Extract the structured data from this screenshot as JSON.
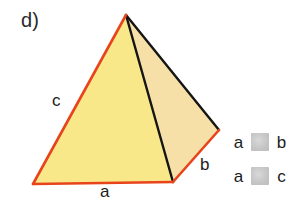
{
  "figure": {
    "item_label": "d)",
    "shape_name": "square pyramid",
    "edge_labels": {
      "left_slant": "c",
      "base_front": "a",
      "base_right": "b"
    },
    "colors": {
      "front_face": "#f8e88a",
      "right_face": "#f6e0a8",
      "highlight_edge": "#e8441c",
      "dark_edge": "#151515",
      "background": "#ffffff",
      "legend_symbol": "#c8c8c8",
      "text": "#1b1b1b"
    },
    "vertices": {
      "apex": [
        126,
        15
      ],
      "base_left": [
        33,
        184
      ],
      "base_front_right": [
        173,
        182
      ],
      "base_right": [
        219,
        130
      ]
    }
  },
  "legend": {
    "rows": [
      {
        "left_term": "a",
        "symbol": "obscured-comparison-symbol",
        "right_term": "b"
      },
      {
        "left_term": "a",
        "symbol": "obscured-comparison-symbol",
        "right_term": "c"
      }
    ]
  }
}
